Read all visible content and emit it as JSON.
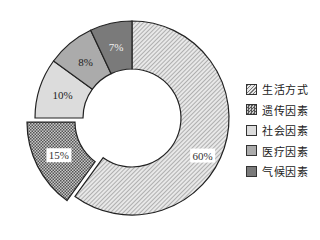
{
  "chart_data": {
    "type": "pie",
    "subtype": "donut",
    "title": "",
    "categories": [
      "生活方式",
      "遗传因素",
      "社会因素",
      "医疗因素",
      "气候因素"
    ],
    "values": [
      60,
      15,
      10,
      8,
      7
    ],
    "labels": [
      "60%",
      "15%",
      "10%",
      "8%",
      "7%"
    ],
    "exploded": [
      "遗传因素"
    ],
    "start_angle": "12 o'clock, clockwise",
    "legend_position": "right",
    "colors": [
      "#d4d4d4",
      "#8a8a8a",
      "#d9d9d9",
      "#ababab",
      "#7a7a7a"
    ],
    "patterns": [
      "diagonal-hatch",
      "crosshatch",
      "solid",
      "solid",
      "solid"
    ]
  },
  "legend": {
    "items": [
      {
        "label": "生活方式"
      },
      {
        "label": "遗传因素"
      },
      {
        "label": "社会因素"
      },
      {
        "label": "医疗因素"
      },
      {
        "label": "气候因素"
      }
    ]
  }
}
